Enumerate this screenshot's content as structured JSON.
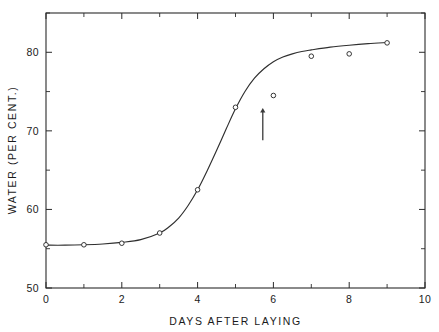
{
  "chart_data": {
    "type": "scatter",
    "title": "",
    "subtitle": "",
    "xlabel": "DAYS  AFTER  LAYING",
    "ylabel": "WATER  (PER  CENT.)",
    "xlim": [
      0,
      10
    ],
    "ylim": [
      50,
      85
    ],
    "grid": false,
    "legend": "none",
    "x_major_ticks": [
      0,
      2,
      4,
      6,
      8,
      10
    ],
    "x_major_tick_labels": [
      "0",
      "2",
      "4",
      "6",
      "8",
      "10"
    ],
    "x_minor_ticks": [
      1,
      3,
      5,
      7,
      9
    ],
    "y_major_ticks": [
      50,
      60,
      70,
      80
    ],
    "y_major_tick_labels": [
      "50",
      "60",
      "70",
      "80"
    ],
    "y_minor_ticks": [
      55,
      65,
      75,
      85
    ],
    "series": [
      {
        "name": "Water content of eggs",
        "marker": "open-circle",
        "x": [
          0,
          1,
          2,
          3,
          4,
          5,
          6,
          7,
          8,
          9
        ],
        "values": [
          55.5,
          55.5,
          55.7,
          57.0,
          62.5,
          73.0,
          74.5,
          79.5,
          79.8,
          81.2
        ]
      },
      {
        "name": "Fitted sigmoid curve",
        "type": "line",
        "x": [
          0.0,
          0.5,
          1.0,
          1.5,
          2.0,
          2.5,
          3.0,
          3.25,
          3.5,
          3.75,
          4.0,
          4.25,
          4.5,
          4.75,
          5.0,
          5.25,
          5.5,
          5.75,
          6.0,
          6.25,
          6.5,
          6.75,
          7.0,
          7.5,
          8.0,
          8.5,
          9.0
        ],
        "values": [
          55.45,
          55.45,
          55.5,
          55.6,
          55.8,
          56.15,
          57.0,
          57.8,
          58.9,
          60.5,
          62.5,
          64.9,
          67.5,
          70.2,
          72.8,
          75.0,
          76.7,
          77.9,
          78.8,
          79.4,
          79.8,
          80.1,
          80.3,
          80.65,
          80.9,
          81.1,
          81.25
        ]
      }
    ],
    "annotations": [
      {
        "name": "up-arrow",
        "kind": "arrow",
        "direction": "up",
        "x": 5.72,
        "y_tail": 68.8,
        "y_head": 72.9
      }
    ]
  }
}
